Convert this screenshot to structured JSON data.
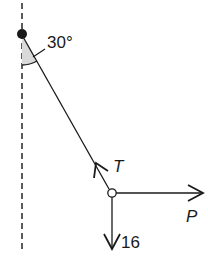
{
  "diagram": {
    "type": "force-diagram",
    "angle_label": "30°",
    "forces": {
      "tension": {
        "label": "T",
        "direction": "along string toward pivot"
      },
      "horizontal": {
        "label": "P",
        "direction": "right"
      },
      "weight": {
        "label": "16",
        "direction": "down"
      }
    },
    "colors": {
      "line": "#1a1a1a",
      "shade": "#d9d9d9",
      "dashed": "#333333"
    }
  }
}
